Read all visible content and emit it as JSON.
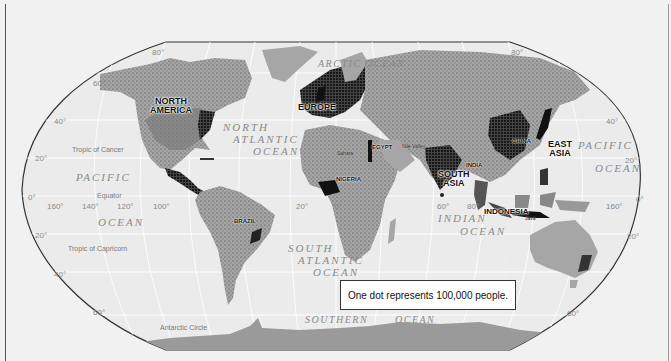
{
  "map": {
    "type": "dot-density world population map",
    "legend": "One dot represents 100,000 people.",
    "colors": {
      "background": "#f1f1f1",
      "ocean": "#eeeeee",
      "land": "#a6a6a6",
      "dense_population": "#111111",
      "graticule": "#ffffff",
      "border": "#333333"
    },
    "regions": {
      "north_america": "NORTH\nAMERICA",
      "europe": "EUROPE",
      "east_asia": "EAST\nASIA",
      "south_asia": "SOUTH\nASIA",
      "indonesia": "INDONESIA"
    },
    "countries": {
      "brazil": "BRAZIL",
      "nigeria": "NIGERIA",
      "egypt": "EGYPT",
      "china": "CHINA",
      "india": "INDIA"
    },
    "features": {
      "sahara": "Sahara",
      "nile_valley": "Nile Valley",
      "java": "Java"
    },
    "oceans": {
      "arctic_1": "ARCTIC",
      "arctic_2": "OCEAN",
      "north_atlantic_1": "NORTH",
      "north_atlantic_2": "ATLANTIC",
      "north_atlantic_3": "OCEAN",
      "pacific_w_1": "PACIFIC",
      "pacific_w_2": "OCEAN",
      "pacific_e_1": "PACIFIC",
      "pacific_e_2": "OCEAN",
      "south_atlantic_1": "SOUTH",
      "south_atlantic_2": "ATLANTIC",
      "south_atlantic_3": "OCEAN",
      "indian_1": "INDIAN",
      "indian_2": "OCEAN",
      "southern_1": "SOUTHERN",
      "southern_2": "OCEAN"
    },
    "lines": {
      "tropic_cancer": "Tropic of Cancer",
      "equator": "Equator",
      "tropic_capricorn": "Tropic of Capricorn",
      "antarctic_circle": "Antarctic Circle"
    },
    "latitude_labels": {
      "w80": "80°",
      "w60": "60°",
      "w40": "40°",
      "w20n": "20°",
      "w0": "0°",
      "w20s": "20°",
      "w40s": "40°",
      "w60s": "60°",
      "e80": "80°",
      "e40": "40°",
      "e20n": "20°",
      "e0": "0°",
      "e20s": "20°",
      "e60s": "60°"
    },
    "longitude_labels": {
      "l160w": "160°",
      "l140w": "140°",
      "l120w": "120°",
      "l100w": "100°",
      "l20w": "20°",
      "l0": "0°",
      "l60e": "60°",
      "l80e": "80°",
      "l160e": "160°"
    }
  }
}
